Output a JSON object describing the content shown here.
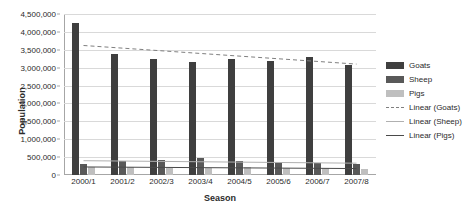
{
  "chart_data": {
    "type": "bar",
    "title": "",
    "xlabel": "Season",
    "ylabel": "Population",
    "categories": [
      "2000/1",
      "2001/2",
      "2002/3",
      "2003/4",
      "2004/5",
      "2005/6",
      "2006/7",
      "2007/8"
    ],
    "ylim": [
      0,
      4500000
    ],
    "ytick_labels": [
      "0",
      "500,000",
      "1,000,000",
      "1,500,000",
      "2,000,000",
      "2,500,000",
      "3,000,000",
      "3,500,000",
      "4,000,000",
      "4,500,000"
    ],
    "ytick_values": [
      0,
      500000,
      1000000,
      1500000,
      2000000,
      2500000,
      3000000,
      3500000,
      4000000,
      4500000
    ],
    "grid": true,
    "legend_position": "right",
    "series": [
      {
        "name": "Goats",
        "color": "#3f3f3f",
        "values": [
          4250000,
          3370000,
          3250000,
          3150000,
          3250000,
          3200000,
          3300000,
          3070000
        ]
      },
      {
        "name": "Sheep",
        "color": "#595959",
        "values": [
          320000,
          400000,
          430000,
          470000,
          400000,
          330000,
          340000,
          300000
        ]
      },
      {
        "name": "Pigs",
        "color": "#bfbfbf",
        "values": [
          220000,
          230000,
          210000,
          200000,
          230000,
          210000,
          190000,
          170000
        ]
      }
    ],
    "trendlines": [
      {
        "name": "Linear (Goats)",
        "color": "#7f7f7f",
        "style": "dashed",
        "start": 3620000,
        "end": 3100000
      },
      {
        "name": "Linear (Sheep)",
        "color": "#b0b0b0",
        "style": "solid",
        "start": 400000,
        "end": 330000
      },
      {
        "name": "Linear (Pigs)",
        "color": "#4a4a4a",
        "style": "solid",
        "start": 225000,
        "end": 180000
      }
    ]
  },
  "legend": {
    "items": [
      {
        "label": "Goats",
        "kind": "swatch",
        "key": "goats"
      },
      {
        "label": "Sheep",
        "kind": "swatch",
        "key": "sheep"
      },
      {
        "label": "Pigs",
        "kind": "swatch",
        "key": "pigs"
      },
      {
        "label": "Linear (Goats)",
        "kind": "dashed",
        "key": "goatsline"
      },
      {
        "label": "Linear (Sheep)",
        "kind": "line",
        "key": "sheepline"
      },
      {
        "label": "Linear (Pigs)",
        "kind": "line",
        "key": "pigsline"
      }
    ]
  }
}
